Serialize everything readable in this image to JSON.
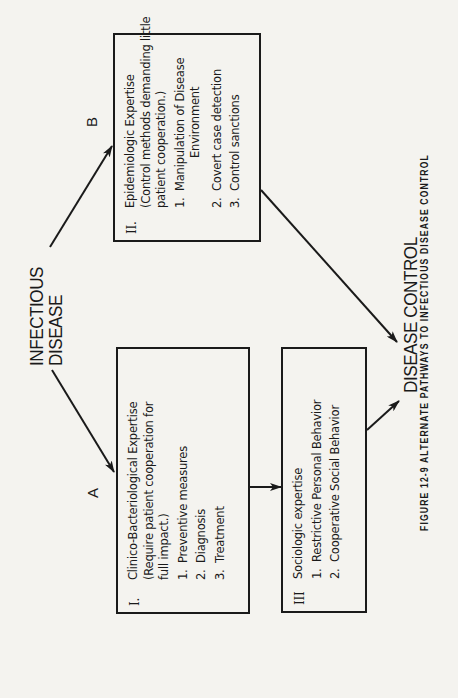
{
  "source": {
    "line1": "INFECTIOUS",
    "line2": "DISEASE"
  },
  "paths": {
    "a_label": "A",
    "b_label": "B"
  },
  "boxes": {
    "clinical": {
      "numeral": "I.",
      "lines": [
        "Clinico-Bacteriological Expertise",
        "(Require patient cooperation for",
        "full impact.)"
      ],
      "items": [
        {
          "num": "1.",
          "text": "Preventive measures"
        },
        {
          "num": "2.",
          "text": "Diagnosis"
        },
        {
          "num": "3.",
          "text": "Treatment"
        }
      ]
    },
    "epidemiologic": {
      "numeral": "II.",
      "lines": [
        "Epidemiologic Expertise",
        "(Control methods demanding little",
        "patient cooperation.)"
      ],
      "items": [
        {
          "num": "1.",
          "text": "Manipulation of Disease",
          "text2": "Environment"
        },
        {
          "num": "2.",
          "text": "Covert case detection"
        },
        {
          "num": "3.",
          "text": "Control sanctions"
        }
      ]
    },
    "sociologic": {
      "numeral": "III",
      "lines": [
        "Sociologic expertise"
      ],
      "items": [
        {
          "num": "1.",
          "text": "Restrictive Personal Behavior"
        },
        {
          "num": "2.",
          "text": "Cooperative Social Behavior"
        }
      ]
    }
  },
  "target": {
    "label": "DISEASE CONTROL"
  },
  "caption": "FIGURE 12-9  ALTERNATE PATHWAYS TO INFECTIOUS DISEASE CONTROL",
  "colors": {
    "ink": "#1a1a1a",
    "paper": "#f4f3ef"
  }
}
